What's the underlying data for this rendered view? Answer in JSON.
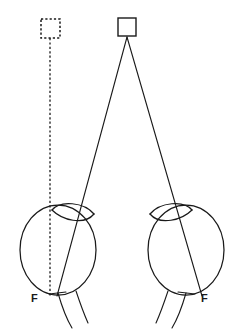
{
  "figure": {
    "type": "diagram",
    "background_color": "#ffffff",
    "ink_color": "#1a1a1a",
    "width": 242,
    "height": 333
  },
  "targets": {
    "real": {
      "name": "real-target-square",
      "style": "solid",
      "x": 118,
      "y": 18,
      "size": 18,
      "center_x": 127,
      "center_y": 27,
      "apex_x": 127,
      "apex_y": 37
    },
    "virtual": {
      "name": "virtual-target-square",
      "style": "dashed",
      "x": 41,
      "y": 19,
      "size": 19,
      "center_x": 50.5,
      "center_y": 28.5
    }
  },
  "rays": {
    "left_ray": {
      "name": "ray-to-left-eye-fovea",
      "style": "solid",
      "from_x": 127,
      "from_y": 37,
      "to_x": 57,
      "to_y": 296
    },
    "right_ray": {
      "name": "ray-to-right-eye-fovea",
      "style": "solid",
      "from_x": 127,
      "from_y": 37,
      "to_x": 202,
      "to_y": 296
    },
    "visual_axis": {
      "name": "dashed-visual-axis-line",
      "style": "dashed",
      "from_x": 50,
      "from_y": 38,
      "to_x": 50,
      "to_y": 296
    }
  },
  "eyes": [
    {
      "name": "left-eye",
      "side": "left",
      "globe": {
        "center_x": 58,
        "center_y": 250,
        "radius_x": 38,
        "radius_y": 45
      },
      "lens": {
        "center_x": 73,
        "center_y": 215,
        "radius_x": 22,
        "radius_y": 9,
        "rotation_deg": -12
      },
      "fovea_label": "F",
      "fovea_label_x": 33,
      "fovea_label_y": 301,
      "fovea_point_x": 57,
      "fovea_point_y": 296,
      "optic_nerve_strands": 2
    },
    {
      "name": "right-eye",
      "side": "right",
      "globe": {
        "center_x": 186,
        "center_y": 250,
        "radius_x": 38,
        "radius_y": 45
      },
      "lens": {
        "center_x": 171,
        "center_y": 215,
        "radius_x": 22,
        "radius_y": 9,
        "rotation_deg": 12
      },
      "fovea_label": "F",
      "fovea_label_x": 203,
      "fovea_label_y": 301,
      "fovea_point_x": 202,
      "fovea_point_y": 296,
      "optic_nerve_strands": 2
    }
  ],
  "labels": {
    "left_fovea": "F",
    "right_fovea": "F"
  }
}
